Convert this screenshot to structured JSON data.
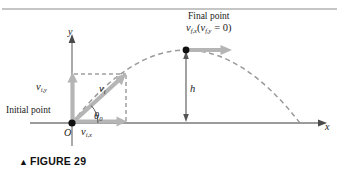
{
  "figure": {
    "caption_marker": "▲",
    "caption_text": "FIGURE 29",
    "topic": "projectile-motion-trajectory"
  },
  "axes": {
    "x_label": "x",
    "y_label": "y",
    "origin_label": "O"
  },
  "labels": {
    "initial_point": "Initial point",
    "final_point_line1": "Final point",
    "final_point_v_symbol": "v",
    "final_point_v_sub": "f,x",
    "final_point_paren_open": "(",
    "final_point_v2_symbol": "v",
    "final_point_v2_sub": "f,y",
    "final_point_equals": " = 0",
    "final_point_paren_close": ")",
    "v_initial_symbol": "v",
    "v_initial_sub": "i",
    "v_ix_symbol": "v",
    "v_ix_sub": "i,x",
    "v_iy_symbol": "v",
    "v_iy_sub": "i,y",
    "theta_symbol": "θ",
    "theta_sub": "0",
    "height_label": "h"
  },
  "colors": {
    "axis": "#7a7a7a",
    "trajectory_dashed": "#9a9a9a",
    "velocity_arrow_gray": "#b5b5b5",
    "point_marker": "#101010",
    "text": "#1a1a1a",
    "top_rule": "#8c8c8c",
    "construction_dashed": "#6f6f6f",
    "height_arrow": "#555555"
  },
  "geometry": {
    "origin_x": 72,
    "origin_y": 123,
    "apex_x": 186,
    "apex_y": 50,
    "landing_x": 300,
    "landing_y": 123,
    "x_axis_end": 322,
    "y_axis_top": 36,
    "launch_angle_degrees": 40
  }
}
